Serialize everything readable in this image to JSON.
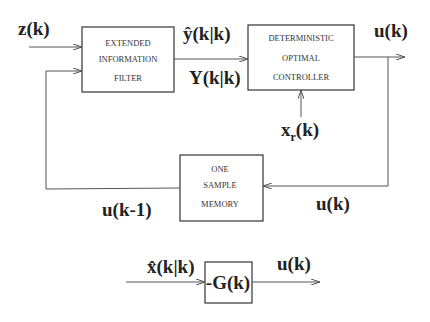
{
  "diagram": {
    "blocks": {
      "filter": {
        "lines": [
          "EXTENDED",
          "INFORMATION",
          "FILTER"
        ]
      },
      "controller": {
        "lines": [
          "DETERMINISTIC",
          "OPTIMAL",
          "CONTROLLER"
        ]
      },
      "memory": {
        "lines": [
          "ONE",
          "SAMPLE",
          "MEMORY"
        ]
      },
      "gain": {
        "label": "-G(k)"
      }
    },
    "signals": {
      "measurement": "z(k)",
      "estimate_y": "ŷ(k|k)",
      "info_matrix": "Y(k|k)",
      "control_out": "u(k)",
      "reference": "x",
      "reference_sub": "r",
      "reference_tail": "(k)",
      "delayed_control": "u(k-1)",
      "memory_in": "u(k)",
      "state_estimate": "x̂(k|k)",
      "gain_out": "u(k)"
    },
    "colors": {
      "line": "#555555",
      "box": "#333333"
    }
  }
}
